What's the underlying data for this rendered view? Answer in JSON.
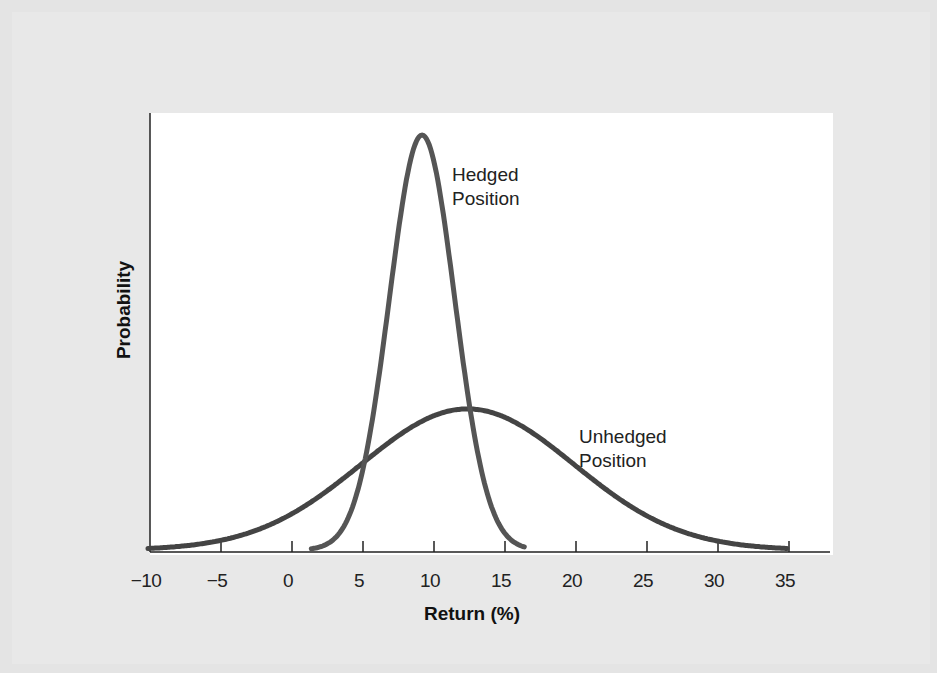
{
  "chart_data": {
    "type": "line",
    "title": "",
    "xlabel": "Return (%)",
    "ylabel": "Probability",
    "xlim": [
      -10,
      35
    ],
    "x_ticks": [
      "−10",
      "−5",
      "0",
      "5",
      "10",
      "15",
      "20",
      "25",
      "30",
      "35"
    ],
    "x_tick_values": [
      -10,
      -5,
      0,
      5,
      10,
      15,
      20,
      25,
      30,
      35
    ],
    "grid": false,
    "legend": "none (inline annotations)",
    "series": [
      {
        "name": "Hedged Position",
        "distribution": "normal",
        "mean": 9.3,
        "std": 2.3,
        "x_range": [
          1.5,
          16.5
        ],
        "relative_peak": 1.0
      },
      {
        "name": "Unhedged Position",
        "distribution": "normal",
        "mean": 12.5,
        "std": 7.5,
        "x_range": [
          -10,
          35
        ],
        "relative_peak": 0.34
      }
    ],
    "annotations": [
      {
        "text": "Hedged Position",
        "near_x": 11.5
      },
      {
        "text": "Unhedged Position",
        "near_x": 20.5
      }
    ]
  },
  "labels": {
    "xlabel": "Return (%)",
    "ylabel": "Probability",
    "hedged_line1": "Hedged",
    "hedged_line2": "Position",
    "unhedged_line1": "Unhedged",
    "unhedged_line2": "Position"
  },
  "colors": {
    "curve": "#444444",
    "axis": "#222222",
    "plot_bg": "#ffffff",
    "page_bg": "#e6e6e6"
  }
}
